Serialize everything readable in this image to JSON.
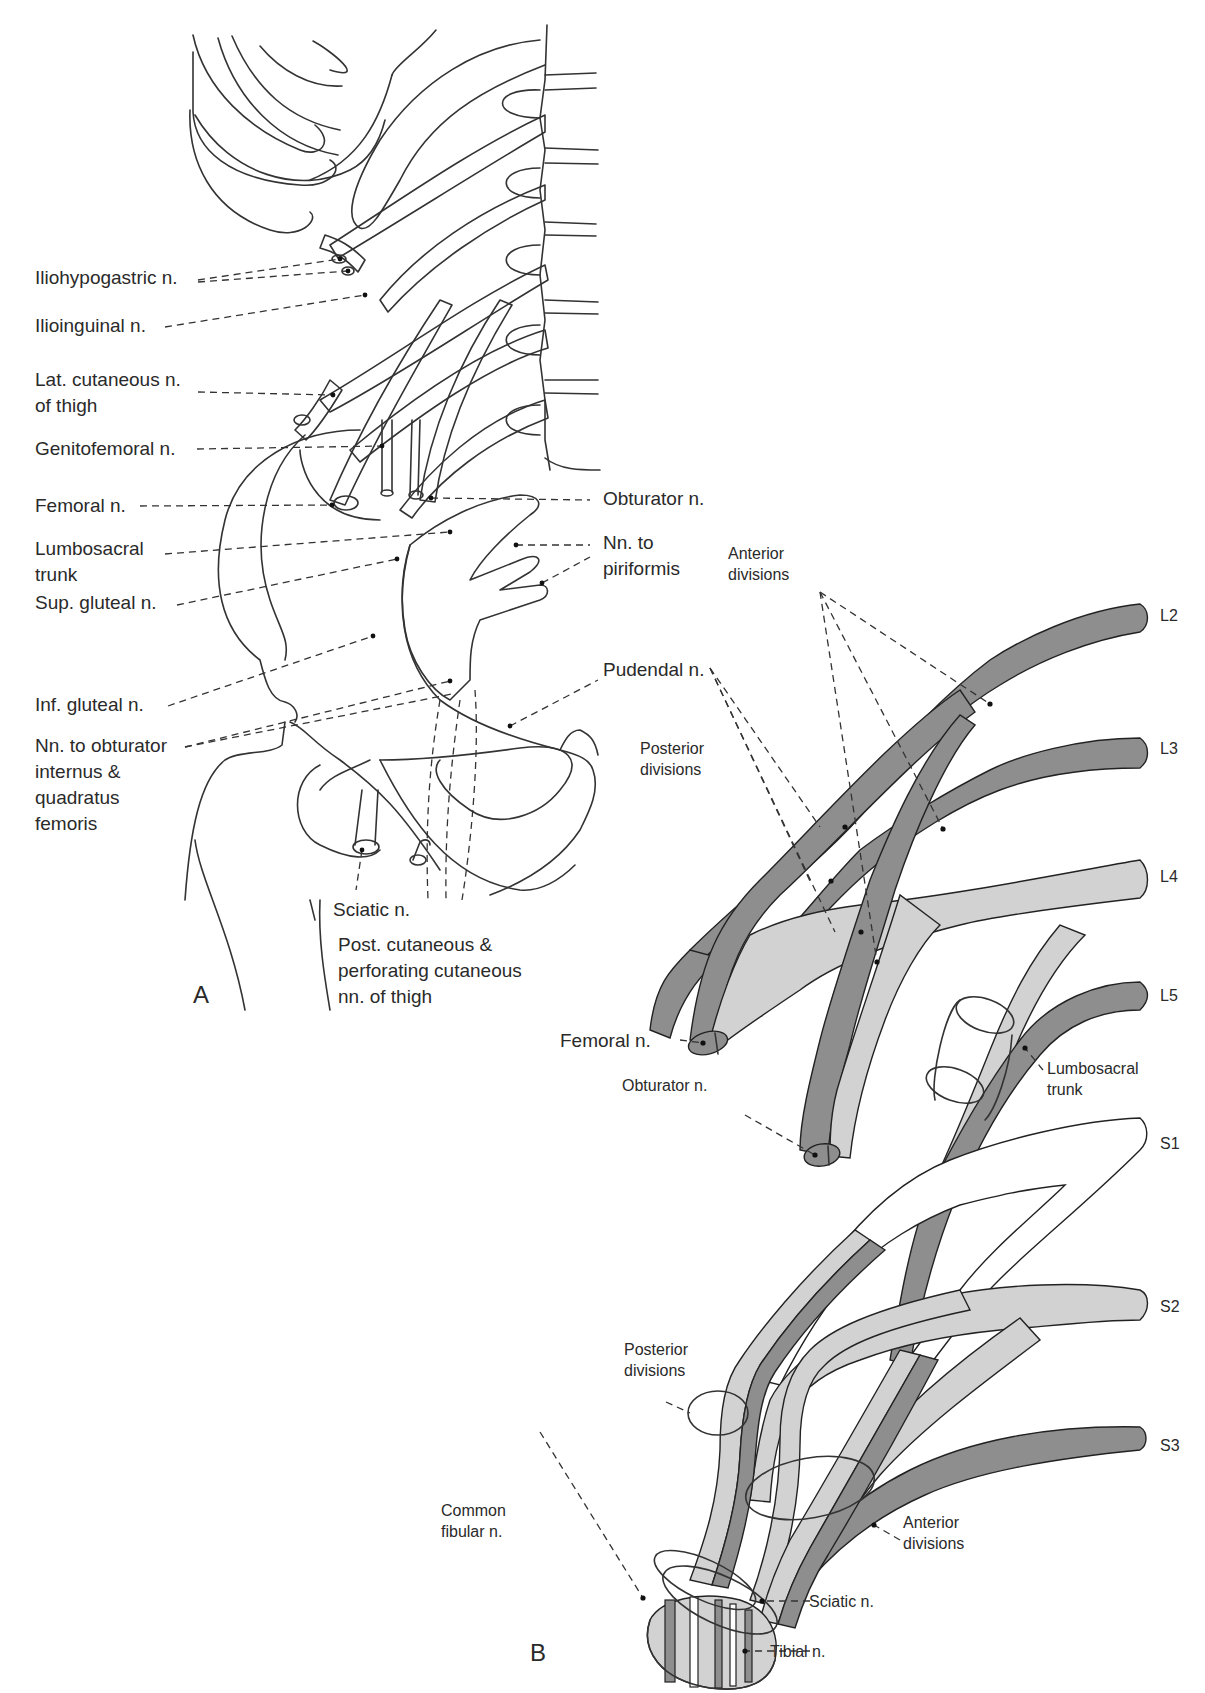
{
  "figure": {
    "panels": [
      "A",
      "B"
    ],
    "colors": {
      "outline": "#2a2a2a",
      "anterior_division_fill": "#8e8e8e",
      "posterior_division_fill": "#d2d2d2",
      "background": "#ffffff"
    }
  },
  "panel_a": {
    "label": "A",
    "labels_left": [
      {
        "id": "iliohypogastric",
        "lines": [
          "Iliohypogastric n."
        ]
      },
      {
        "id": "ilioinguinal",
        "lines": [
          "Ilioinguinal n."
        ]
      },
      {
        "id": "lat_cutaneous",
        "lines": [
          "Lat. cutaneous n.",
          "of thigh"
        ]
      },
      {
        "id": "genitofemoral",
        "lines": [
          "Genitofemoral n."
        ]
      },
      {
        "id": "femoral",
        "lines": [
          "Femoral n."
        ]
      },
      {
        "id": "lumbosacral_trunk",
        "lines": [
          "Lumbosacral",
          "trunk"
        ]
      },
      {
        "id": "sup_gluteal",
        "lines": [
          "Sup. gluteal n."
        ]
      },
      {
        "id": "inf_gluteal",
        "lines": [
          "Inf. gluteal n."
        ]
      },
      {
        "id": "nn_obturator_internus",
        "lines": [
          "Nn. to obturator",
          "internus &",
          "quadratus",
          "femoris"
        ]
      }
    ],
    "labels_right": [
      {
        "id": "obturator",
        "lines": [
          "Obturator n."
        ]
      },
      {
        "id": "nn_piriformis",
        "lines": [
          "Nn. to",
          "piriformis"
        ]
      },
      {
        "id": "pudendal",
        "lines": [
          "Pudendal n."
        ]
      }
    ],
    "labels_bottom": [
      {
        "id": "sciatic",
        "lines": [
          "Sciatic n."
        ]
      },
      {
        "id": "post_cutaneous",
        "lines": [
          "Post. cutaneous &",
          "perforating cutaneous",
          "nn. of thigh"
        ]
      }
    ]
  },
  "panel_b": {
    "label": "B",
    "roots": [
      "L2",
      "L3",
      "L4",
      "L5",
      "S1",
      "S2",
      "S3"
    ],
    "annotations": {
      "anterior_divisions_top": [
        "Anterior",
        "divisions"
      ],
      "posterior_divisions_top": [
        "Posterior",
        "divisions"
      ],
      "femoral": [
        "Femoral n."
      ],
      "obturator": [
        "Obturator n."
      ],
      "lumbosacral_trunk": [
        "Lumbosacral",
        "trunk"
      ],
      "posterior_divisions_bottom": [
        "Posterior",
        "divisions"
      ],
      "anterior_divisions_bottom": [
        "Anterior",
        "divisions"
      ],
      "common_fibular": [
        "Common",
        "fibular n."
      ],
      "sciatic": [
        "Sciatic n."
      ],
      "tibial": [
        "Tibial n."
      ]
    }
  }
}
